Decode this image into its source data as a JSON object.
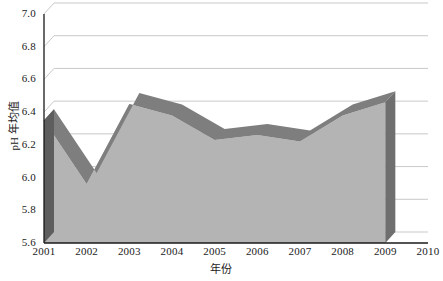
{
  "chart_data": {
    "type": "area",
    "title": "",
    "xlabel": "年份",
    "ylabel": "pH 年均值",
    "x": [
      2001,
      2002,
      2003,
      2004,
      2005,
      2006,
      2007,
      2008,
      2009
    ],
    "values": [
      6.35,
      5.96,
      6.45,
      6.38,
      6.23,
      6.26,
      6.22,
      6.38,
      6.46
    ],
    "series": [
      {
        "name": "pH 年均值",
        "values": [
          6.35,
          5.96,
          6.45,
          6.38,
          6.23,
          6.26,
          6.22,
          6.38,
          6.46
        ]
      }
    ],
    "xlim": [
      2001,
      2010
    ],
    "ylim": [
      5.6,
      7.0
    ],
    "ytick_labels": [
      "7.0",
      "6.8",
      "6.6",
      "6.4",
      "6.2",
      "6.0",
      "5.8",
      "5.6"
    ],
    "ytick_values": [
      7.0,
      6.8,
      6.6,
      6.4,
      6.2,
      6.0,
      5.8,
      5.6
    ],
    "xtick_labels": [
      "2001",
      "2002",
      "2003",
      "2004",
      "2005",
      "2006",
      "2007",
      "2008",
      "2009",
      "2010"
    ],
    "grid": true,
    "grid_axis": "y",
    "legend": false,
    "legend_position": "none",
    "three_d": true,
    "colors": {
      "area_front": "#b4b4b4",
      "area_top": "#7e7e7e",
      "area_side": "#5e5e5e",
      "gridline": "#c9c9c9",
      "axis": "#1a1a1a",
      "text": "#1a1a1a",
      "background": "#ffffff"
    }
  }
}
